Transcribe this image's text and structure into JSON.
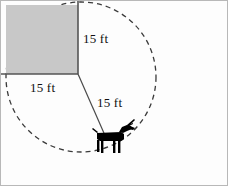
{
  "figure": {
    "background_color": "#fdfdfd",
    "frame_color": "#b8b8b8",
    "line_color": "#4a4a4a",
    "shed_fill_color": "#c8c8c8",
    "shed_edge_color": "#555555",
    "dash_color": "#3a3a3a",
    "animal_color": "#000000"
  },
  "labels": {
    "vertical_side": "15 ft",
    "horizontal_side": "15 ft",
    "tether_radius": "15 ft"
  },
  "geometry": {
    "shed": {
      "x": 5,
      "y": 4,
      "width": 72,
      "height": 69
    },
    "circle": {
      "center_x": 80,
      "center_y": 76,
      "radius": 75,
      "dashed": true
    },
    "tether_line": {
      "x1": 77,
      "y1": 73,
      "x2": 106,
      "y2": 139
    },
    "animal": {
      "x": 93,
      "y": 128,
      "width": 32,
      "height": 24,
      "name": "goat"
    }
  },
  "icons": {
    "animal": "goat-icon",
    "shed": "shed-square-icon",
    "grazing_boundary": "dashed-circle-icon"
  }
}
